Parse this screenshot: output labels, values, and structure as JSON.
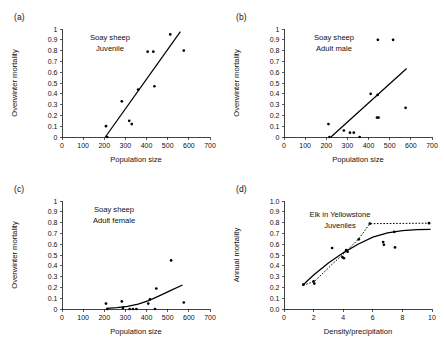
{
  "figure": {
    "panels": [
      {
        "id": "a",
        "label": "(a)",
        "annotation_line1": "Soay sheep",
        "annotation_line2": "Juvenile"
      },
      {
        "id": "b",
        "label": "(b)",
        "annotation_line1": "Soay sheep",
        "annotation_line2": "Adult male"
      },
      {
        "id": "c",
        "label": "(c)",
        "annotation_line1": "Soay sheep",
        "annotation_line2": "Adult female"
      },
      {
        "id": "d",
        "label": "(d)",
        "annotation_line1": "Elk in Yellowstone",
        "annotation_line2": "Juveniles"
      }
    ]
  },
  "chart_data": [
    {
      "panel": "a",
      "type": "scatter",
      "title": "Soay sheep Juvenile",
      "xlabel": "Population size",
      "ylabel": "Overwinter mortality",
      "xlim": [
        0,
        700
      ],
      "ylim": [
        0,
        1
      ],
      "xticks": [
        0,
        100,
        200,
        300,
        400,
        500,
        600,
        700
      ],
      "xticklabels": [
        "0",
        "100",
        "200",
        "300",
        "400",
        "500",
        "600",
        "700"
      ],
      "yticks": [
        0,
        0.1,
        0.2,
        0.3,
        0.4,
        0.5,
        0.6,
        0.7,
        0.8,
        0.9,
        1
      ],
      "yticklabels": [
        "0",
        "0.1",
        "0.2",
        "0.3",
        "0.4",
        "0.5",
        "0.6",
        "0.7",
        "0.8",
        "0.9",
        "1"
      ],
      "grid": false,
      "legend": "none",
      "points": [
        {
          "x": 208,
          "y": 0.1
        },
        {
          "x": 214,
          "y": 0.0
        },
        {
          "x": 283,
          "y": 0.33
        },
        {
          "x": 318,
          "y": 0.15
        },
        {
          "x": 330,
          "y": 0.12
        },
        {
          "x": 360,
          "y": 0.44
        },
        {
          "x": 405,
          "y": 0.79
        },
        {
          "x": 432,
          "y": 0.79
        },
        {
          "x": 437,
          "y": 0.47
        },
        {
          "x": 512,
          "y": 0.95
        },
        {
          "x": 576,
          "y": 0.8
        }
      ],
      "fit": {
        "style": "solid",
        "x": [
          205,
          560
        ],
        "y": [
          0.0,
          0.975
        ]
      }
    },
    {
      "panel": "b",
      "type": "scatter",
      "title": "Soay sheep Adult male",
      "xlabel": "Population size",
      "ylabel": "Overwinter mortality",
      "xlim": [
        0,
        700
      ],
      "ylim": [
        0,
        1
      ],
      "xticks": [
        0,
        100,
        200,
        300,
        400,
        500,
        600,
        700
      ],
      "xticklabels": [
        "0",
        "100",
        "200",
        "300",
        "400",
        "500",
        "600",
        "700"
      ],
      "yticks": [
        0,
        0.1,
        0.2,
        0.3,
        0.4,
        0.5,
        0.6,
        0.7,
        0.8,
        0.9,
        1
      ],
      "yticklabels": [
        "0",
        "0.1",
        "0.2",
        "0.3",
        "0.4",
        "0.5",
        "0.6",
        "0.7",
        "0.8",
        "0.9",
        "1"
      ],
      "grid": false,
      "legend": "none",
      "points": [
        {
          "x": 210,
          "y": 0.12
        },
        {
          "x": 215,
          "y": 0.0
        },
        {
          "x": 283,
          "y": 0.06
        },
        {
          "x": 312,
          "y": 0.04
        },
        {
          "x": 330,
          "y": 0.04
        },
        {
          "x": 358,
          "y": 0.0
        },
        {
          "x": 410,
          "y": 0.4
        },
        {
          "x": 440,
          "y": 0.18
        },
        {
          "x": 443,
          "y": 0.39
        },
        {
          "x": 444,
          "y": 0.9
        },
        {
          "x": 447,
          "y": 0.18
        },
        {
          "x": 516,
          "y": 0.9
        },
        {
          "x": 575,
          "y": 0.27
        }
      ],
      "fit": {
        "style": "solid",
        "x": [
          222,
          580
        ],
        "y": [
          0.0,
          0.635
        ]
      }
    },
    {
      "panel": "c",
      "type": "scatter",
      "title": "Soay sheep Adult female",
      "xlabel": "Population size",
      "ylabel": "Overwinter mortality",
      "xlim": [
        0,
        700
      ],
      "ylim": [
        0,
        1
      ],
      "xticks": [
        0,
        100,
        200,
        300,
        400,
        500,
        600,
        700
      ],
      "xticklabels": [
        "0",
        "100",
        "200",
        "300",
        "400",
        "500",
        "600",
        "700"
      ],
      "yticks": [
        0,
        0.1,
        0.2,
        0.3,
        0.4,
        0.5,
        0.6,
        0.7,
        0.8,
        0.9,
        1
      ],
      "yticklabels": [
        "0",
        "0.1",
        "0.2",
        "0.3",
        "0.4",
        "0.5",
        "0.6",
        "0.7",
        "0.8",
        "0.9",
        "1"
      ],
      "grid": false,
      "legend": "none",
      "points": [
        {
          "x": 208,
          "y": 0.05
        },
        {
          "x": 214,
          "y": 0.0
        },
        {
          "x": 283,
          "y": 0.07
        },
        {
          "x": 288,
          "y": 0.01
        },
        {
          "x": 320,
          "y": 0.0
        },
        {
          "x": 336,
          "y": 0.0
        },
        {
          "x": 352,
          "y": 0.0
        },
        {
          "x": 408,
          "y": 0.05
        },
        {
          "x": 416,
          "y": 0.09
        },
        {
          "x": 440,
          "y": 0.0
        },
        {
          "x": 446,
          "y": 0.19
        },
        {
          "x": 516,
          "y": 0.45
        },
        {
          "x": 576,
          "y": 0.06
        }
      ],
      "fit": {
        "style": "solid-curve",
        "points": [
          {
            "x": 210,
            "y": 0.005
          },
          {
            "x": 260,
            "y": 0.012
          },
          {
            "x": 310,
            "y": 0.024
          },
          {
            "x": 360,
            "y": 0.045
          },
          {
            "x": 410,
            "y": 0.078
          },
          {
            "x": 460,
            "y": 0.122
          },
          {
            "x": 510,
            "y": 0.168
          },
          {
            "x": 570,
            "y": 0.222
          }
        ]
      }
    },
    {
      "panel": "d",
      "type": "scatter",
      "title": "Elk in Yellowstone Juveniles",
      "xlabel": "Density/precipitation",
      "ylabel": "Annual mortality",
      "xlim": [
        0,
        10
      ],
      "ylim": [
        0,
        1
      ],
      "xticks": [
        0,
        2,
        4,
        6,
        8,
        10
      ],
      "xticklabels": [
        "0",
        "2",
        "4",
        "6",
        "8",
        "10"
      ],
      "yticks": [
        0,
        0.1,
        0.2,
        0.3,
        0.4,
        0.5,
        0.6,
        0.7,
        0.8,
        0.9,
        1
      ],
      "yticklabels": [
        "0.0",
        "0.1",
        "0.2",
        "0.3",
        "0.4",
        "0.5",
        "0.6",
        "0.7",
        "0.8",
        "0.9",
        "1.0"
      ],
      "grid": false,
      "legend": "none",
      "points": [
        {
          "x": 1.3,
          "y": 0.225
        },
        {
          "x": 2.0,
          "y": 0.255
        },
        {
          "x": 2.05,
          "y": 0.235
        },
        {
          "x": 3.25,
          "y": 0.565
        },
        {
          "x": 3.95,
          "y": 0.48
        },
        {
          "x": 4.05,
          "y": 0.47
        },
        {
          "x": 4.2,
          "y": 0.545
        },
        {
          "x": 4.3,
          "y": 0.53
        },
        {
          "x": 5.05,
          "y": 0.645
        },
        {
          "x": 5.8,
          "y": 0.79
        },
        {
          "x": 6.7,
          "y": 0.62
        },
        {
          "x": 6.75,
          "y": 0.595
        },
        {
          "x": 7.45,
          "y": 0.715
        },
        {
          "x": 7.5,
          "y": 0.57
        },
        {
          "x": 9.8,
          "y": 0.795
        }
      ],
      "fit": {
        "style": "solid-curve",
        "points": [
          {
            "x": 1.3,
            "y": 0.225
          },
          {
            "x": 2.0,
            "y": 0.315
          },
          {
            "x": 3.0,
            "y": 0.425
          },
          {
            "x": 4.0,
            "y": 0.52
          },
          {
            "x": 5.0,
            "y": 0.6
          },
          {
            "x": 6.0,
            "y": 0.665
          },
          {
            "x": 7.0,
            "y": 0.705
          },
          {
            "x": 8.0,
            "y": 0.725
          },
          {
            "x": 9.0,
            "y": 0.735
          },
          {
            "x": 9.9,
            "y": 0.738
          }
        ]
      },
      "fit_dotted": {
        "style": "dotted",
        "points": [
          {
            "x": 1.3,
            "y": 0.22
          },
          {
            "x": 2.05,
            "y": 0.255
          },
          {
            "x": 3.3,
            "y": 0.42
          },
          {
            "x": 4.25,
            "y": 0.54
          },
          {
            "x": 5.05,
            "y": 0.65
          },
          {
            "x": 5.8,
            "y": 0.79
          },
          {
            "x": 9.85,
            "y": 0.795
          }
        ]
      }
    }
  ]
}
